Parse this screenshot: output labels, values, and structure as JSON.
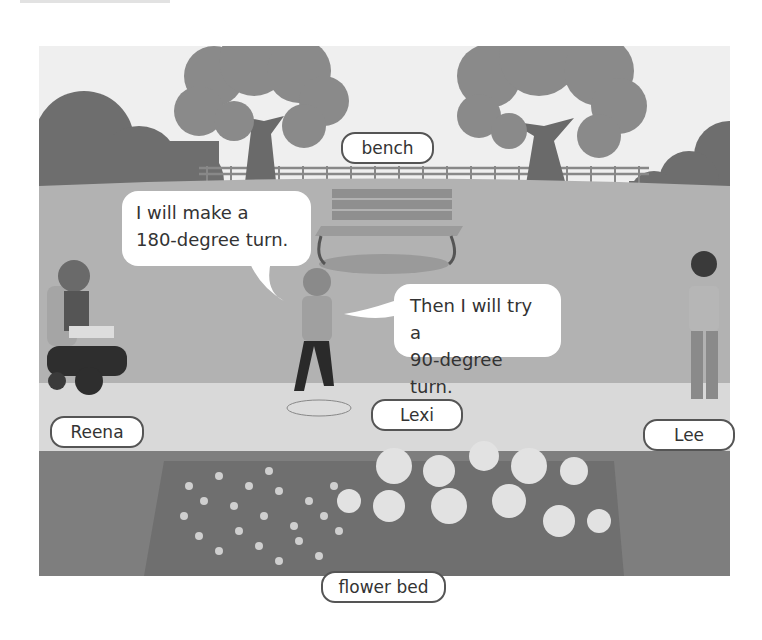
{
  "scene": {
    "description": "Park scene with characters talking about turns",
    "colors": {
      "sky": "#efefef",
      "bush": "#6e6e6e",
      "tree_canopy": "#8a8a8a",
      "tree_trunk": "#6a6a6a",
      "lawn": "#b2b2b2",
      "path": "#d9d9d9",
      "flower_bed_ground": "#7e7e7e",
      "label_border": "#555555",
      "text": "#333333"
    }
  },
  "labels": {
    "bench": "bench",
    "reena": "Reena",
    "lexi": "Lexi",
    "lee": "Lee",
    "flower_bed": "flower bed"
  },
  "speech_bubbles": [
    {
      "speaker": "Lexi",
      "lines": [
        "I will make a",
        "180-degree turn."
      ]
    },
    {
      "speaker": "Lexi",
      "lines": [
        "Then I will try a",
        "90-degree turn."
      ]
    }
  ]
}
